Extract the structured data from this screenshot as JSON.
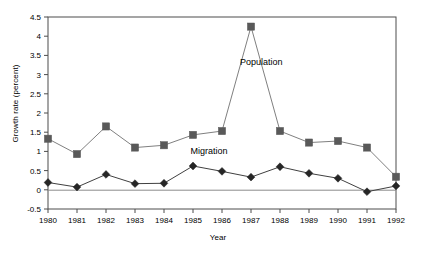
{
  "chart_data": {
    "type": "line",
    "title": "",
    "xlabel": "Year",
    "ylabel": "Growth rate (percent)",
    "categories": [
      "1980",
      "1981",
      "1982",
      "1983",
      "1984",
      "1985",
      "1986",
      "1987",
      "1988",
      "1989",
      "1990",
      "1991",
      "1992"
    ],
    "xlim": [
      1980,
      1992
    ],
    "ylim": [
      -0.5,
      4.5
    ],
    "yticks": [
      "-0.5",
      "0",
      "0.5",
      "1",
      "1.5",
      "2",
      "2.5",
      "3",
      "3.5",
      "4",
      "4.5"
    ],
    "ytick_values": [
      -0.5,
      0,
      0.5,
      1,
      1.5,
      2,
      2.5,
      3,
      3.5,
      4,
      4.5
    ],
    "grid": false,
    "legend_position": "inline-annotation",
    "zero_line": true,
    "series": [
      {
        "name": "Population",
        "marker": "square",
        "color": "#595959",
        "line_color": "#808080",
        "label_x": 1987.35,
        "label_y": 3.25,
        "values": [
          1.33,
          0.93,
          1.65,
          1.1,
          1.16,
          1.43,
          1.53,
          4.25,
          1.53,
          1.23,
          1.27,
          1.1,
          0.34
        ]
      },
      {
        "name": "Migration",
        "marker": "diamond",
        "color": "#262626",
        "line_color": "#404040",
        "label_x": 1985.55,
        "label_y": 0.92,
        "values": [
          0.19,
          0.07,
          0.4,
          0.16,
          0.17,
          0.62,
          0.48,
          0.33,
          0.6,
          0.43,
          0.3,
          -0.05,
          0.1
        ]
      }
    ]
  },
  "axis": {
    "y_title": "Growth rate (percent)",
    "x_title": "Year"
  }
}
